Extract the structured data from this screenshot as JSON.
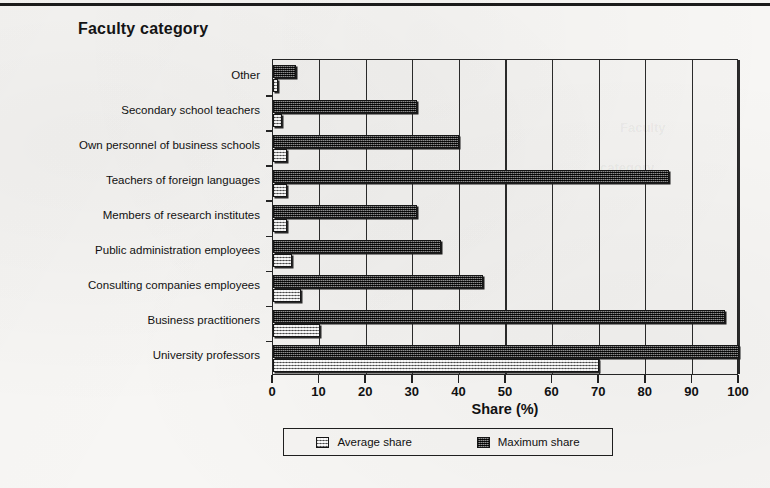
{
  "title": "Faculty category",
  "axis": {
    "xlabel": "Share (%)",
    "xticks": [
      "0",
      "10",
      "20",
      "30",
      "40",
      "50",
      "60",
      "70",
      "80",
      "90",
      "100"
    ]
  },
  "legend": {
    "items": [
      {
        "label": "Average share",
        "swatch": "light-checker-swatch",
        "color": "#c2c2c2"
      },
      {
        "label": "Maximum share",
        "swatch": "dark-checker-swatch",
        "color": "#3a3a3a"
      }
    ]
  },
  "chart_data": {
    "type": "bar",
    "orientation": "horizontal",
    "title": "Faculty category",
    "xlabel": "Share (%)",
    "ylabel": "",
    "xlim": [
      0,
      100
    ],
    "grid": true,
    "legend_position": "bottom",
    "categories": [
      "Other",
      "Secondary school teachers",
      "Own personnel of business schools",
      "Teachers of foreign languages",
      "Members of research institutes",
      "Public administration employees",
      "Consulting companies employees",
      "Business practitioners",
      "University professors"
    ],
    "series": [
      {
        "name": "Average share",
        "values": [
          1,
          2,
          3,
          3,
          3,
          4,
          6,
          10,
          70
        ]
      },
      {
        "name": "Maximum share",
        "values": [
          5,
          31,
          40,
          85,
          31,
          36,
          45,
          97,
          100
        ]
      }
    ]
  }
}
